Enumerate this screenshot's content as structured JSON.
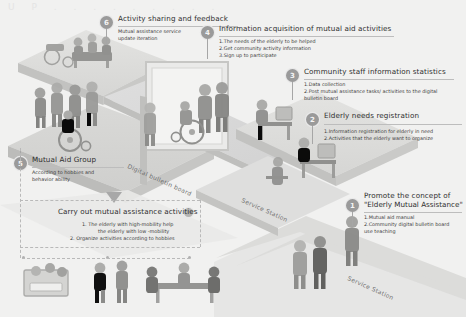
{
  "meta": {
    "background_color": "#f1f1f0",
    "accent_color": "#9a9a9a",
    "text_color": "#3b3b3b"
  },
  "watermark": "U P . . . . . . . . .",
  "road_labels": [
    {
      "text": "Digital bulletin board"
    },
    {
      "text": "Service Station"
    },
    {
      "text": "Service Station"
    }
  ],
  "steps": [
    {
      "number": "1",
      "title": "Promote the concept of",
      "title2": "\"Elderly Mutual Assistance\"",
      "items": [
        "1.Mutual aid manual",
        "2.Community digital bulletin board",
        "use teaching"
      ]
    },
    {
      "number": "2",
      "title": "Elderly needs registration",
      "title2": "",
      "items": [
        "1.Information registration for elderly in need",
        "2.Activities that the elderly want to organize"
      ]
    },
    {
      "number": "3",
      "title": "Community staff information statistics",
      "title2": "",
      "items": [
        "1.Data collection",
        "2.Post mutual assistance tasks/ activities to the  digital",
        "bulletin board"
      ]
    },
    {
      "number": "4",
      "title": "Information acquisition of mutual aid activities",
      "title2": "",
      "items": [
        "1.The needs of the elderly to be helped",
        "2.Get community activity information",
        "3.Sign up to participate"
      ]
    },
    {
      "number": "5",
      "title": "Mutual Aid Group",
      "title2": "",
      "items": [
        "According to hobbies and",
        "behavior ability"
      ]
    },
    {
      "number": "6",
      "title": "Activity sharing and feedback",
      "title2": "",
      "items": [
        "Mutual assistance service",
        "update iteration"
      ]
    }
  ],
  "bottom_section": {
    "title": "Carry out mutual assistance activities",
    "items": [
      "1. The elderly with high-mobility help",
      "the elderly with low -mobility",
      "2. Organize activities according to hobbies"
    ]
  }
}
